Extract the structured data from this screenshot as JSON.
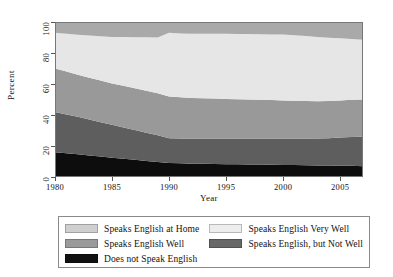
{
  "chart_data": {
    "type": "area",
    "stacked": true,
    "title": "",
    "xlabel": "Year",
    "ylabel": "Percent",
    "xlim": [
      1980,
      2007
    ],
    "ylim": [
      0,
      100
    ],
    "grid": false,
    "legend_position": "bottom",
    "x_ticks": [
      "1980",
      "1985",
      "1990",
      "1995",
      "2000",
      "2005"
    ],
    "x_tick_values": [
      1980,
      1985,
      1990,
      1995,
      2000,
      2005
    ],
    "y_ticks": [
      "0",
      "20",
      "40",
      "60",
      "80",
      "100"
    ],
    "y_tick_values": [
      0,
      20,
      40,
      60,
      80,
      100
    ],
    "x": [
      1980,
      1981,
      1982,
      1983,
      1984,
      1985,
      1986,
      1987,
      1988,
      1989,
      1990,
      1991,
      1992,
      1993,
      1994,
      1995,
      1996,
      1997,
      1998,
      1999,
      2000,
      2001,
      2002,
      2003,
      2004,
      2005,
      2006,
      2007
    ],
    "series": [
      {
        "name": "Does not Speak English",
        "color": "#0d0d0d",
        "values": [
          16.0,
          15.3,
          14.6,
          13.9,
          13.2,
          12.5,
          11.8,
          11.1,
          10.4,
          9.7,
          9.0,
          8.8,
          8.6,
          8.5,
          8.4,
          8.3,
          8.2,
          8.1,
          8.0,
          7.9,
          7.8,
          7.7,
          7.6,
          7.5,
          7.4,
          7.3,
          7.2,
          7.0
        ]
      },
      {
        "name": "Speaks English, but Not Well",
        "color": "#5e5e5e",
        "values": [
          26.0,
          25.1,
          24.2,
          23.2,
          22.2,
          21.2,
          20.2,
          19.2,
          18.2,
          17.2,
          16.0,
          16.1,
          16.2,
          16.3,
          16.4,
          16.5,
          16.6,
          16.7,
          16.8,
          16.9,
          17.0,
          17.1,
          17.2,
          17.3,
          17.6,
          18.2,
          18.6,
          19.0
        ]
      },
      {
        "name": "Speaks English Well",
        "color": "#999999",
        "values": [
          28.0,
          27.6,
          27.2,
          27.0,
          26.8,
          26.7,
          26.8,
          26.9,
          27.0,
          27.1,
          27.0,
          26.5,
          26.2,
          26.0,
          25.8,
          25.6,
          25.4,
          25.2,
          25.0,
          24.8,
          24.6,
          24.4,
          24.2,
          24.1,
          24.0,
          23.9,
          24.0,
          24.0
        ]
      },
      {
        "name": "Speaks English Very Well",
        "color": "#e6e6e6",
        "values": [
          23.0,
          24.4,
          25.8,
          27.2,
          28.6,
          30.0,
          31.5,
          33.0,
          34.5,
          36.0,
          41.0,
          41.2,
          41.4,
          41.6,
          41.8,
          42.0,
          42.1,
          42.2,
          42.3,
          42.4,
          42.5,
          42.3,
          41.9,
          41.5,
          40.9,
          40.1,
          39.2,
          38.6
        ]
      },
      {
        "name": "Speaks English at Home",
        "color": "#a9a9a9",
        "values": [
          7.0,
          7.6,
          8.2,
          8.7,
          9.2,
          9.6,
          9.7,
          9.8,
          9.9,
          10.0,
          7.0,
          7.4,
          7.6,
          7.6,
          7.6,
          7.6,
          7.7,
          7.8,
          7.9,
          8.0,
          8.1,
          8.5,
          9.1,
          9.6,
          10.1,
          10.5,
          11.0,
          11.4
        ]
      }
    ],
    "legend_entries": [
      {
        "label": "Speaks English at Home",
        "color": "#cfcfcf",
        "column": 0,
        "row": 0
      },
      {
        "label": "Speaks English Very Well",
        "color": "#ededed",
        "column": 1,
        "row": 0
      },
      {
        "label": "Speaks English Well",
        "color": "#9a9a9a",
        "column": 0,
        "row": 1
      },
      {
        "label": "Speaks English, but Not Well",
        "color": "#686868",
        "column": 1,
        "row": 1
      },
      {
        "label": "Does not Speak English",
        "color": "#111111",
        "column": 0,
        "row": 2
      }
    ]
  }
}
